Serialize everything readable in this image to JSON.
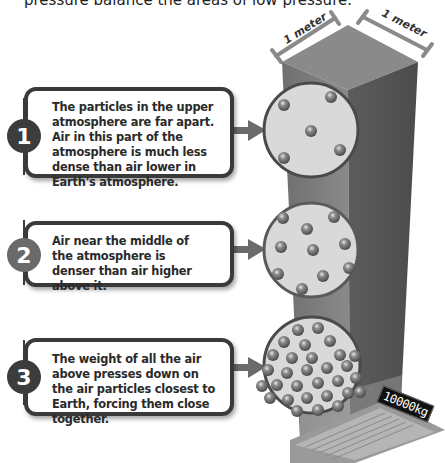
{
  "header": {
    "text": "pressure balance the areas of low pressure."
  },
  "dimensions": {
    "left_label": "1 meter",
    "right_label": "1 meter"
  },
  "callouts": [
    {
      "number": "1",
      "text": "The particles in the upper atmosphere are far apart. Air in this part of the atmosphere is much less dense than air lower in Earth's atmosphere.",
      "badge_color": "#3c3c3c",
      "particle_count": 5
    },
    {
      "number": "2",
      "text": "Air near the middle of the atmosphere is denser than air higher above it.",
      "badge_color": "#6a6a6a",
      "particle_count": 10
    },
    {
      "number": "3",
      "text": "The weight of all the air above presses down on the air particles closest to Earth, forcing them close together.",
      "badge_color": "#3c3c3c",
      "particle_count": 30
    }
  ],
  "scale": {
    "reading": "10000kg"
  },
  "colors": {
    "column_front": "#7d7d7d",
    "column_side": "#5e5e5e",
    "column_top": "#8a8a8a",
    "circle_fill": "#d8d8d8",
    "circle_border": "#4a4a4a",
    "particle": "#7a7a7a",
    "arrow": "#6b6b6b",
    "dimension_line": "#8a8a8a"
  }
}
